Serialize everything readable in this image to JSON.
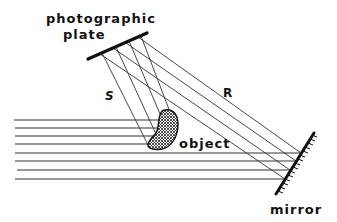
{
  "diagram": {
    "type": "holography-recording-setup",
    "labels": {
      "plate_line1": "photographic",
      "plate_line2": "plate",
      "object_beam": "S",
      "reference_beam": "R",
      "object": "object",
      "mirror": "mirror"
    },
    "colors": {
      "ink": "#111111",
      "beam": "#333333",
      "background": "#ffffff"
    },
    "components": {
      "plate": {
        "x1": 88,
        "y1": 59,
        "x2": 147,
        "y2": 33
      },
      "mirror": {
        "x1": 276,
        "y1": 194,
        "x2": 314,
        "y2": 133
      },
      "object_center": [
        164,
        130
      ]
    },
    "incident_beams_y": [
      120,
      128,
      136,
      144,
      153,
      161,
      170,
      179
    ],
    "beam_count": {
      "incident": 8,
      "object_wave_S": 4,
      "reference_wave_R": 4
    }
  }
}
